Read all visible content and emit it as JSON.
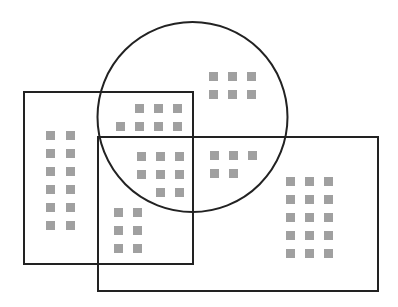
{
  "colors": {
    "background": "#ffffff",
    "stroke": "#222222",
    "square_fill": "#a0a0a0"
  },
  "shapes": {
    "left_rect": {
      "x": 24,
      "y": 92,
      "w": 169,
      "h": 172
    },
    "large_rect": {
      "x": 98,
      "y": 137,
      "w": 280,
      "h": 154
    },
    "circle": {
      "cx": 192.5,
      "cy": 117,
      "r": 95
    }
  },
  "square_size": 9,
  "regions": [
    {
      "name": "left-only",
      "count": 12,
      "squares": [
        [
          46,
          131
        ],
        [
          66,
          131
        ],
        [
          46,
          149
        ],
        [
          66,
          149
        ],
        [
          46,
          167
        ],
        [
          66,
          167
        ],
        [
          46,
          185
        ],
        [
          66,
          185
        ],
        [
          46,
          203
        ],
        [
          66,
          203
        ],
        [
          46,
          221
        ],
        [
          66,
          221
        ]
      ]
    },
    {
      "name": "left-and-circle",
      "count": 7,
      "squares": [
        [
          135,
          104
        ],
        [
          154,
          104
        ],
        [
          173,
          104
        ],
        [
          116,
          122
        ],
        [
          135,
          122
        ],
        [
          154,
          122
        ],
        [
          173,
          122
        ]
      ]
    },
    {
      "name": "left-circle-large",
      "count": 8,
      "squares": [
        [
          137,
          152
        ],
        [
          156,
          152
        ],
        [
          175,
          152
        ],
        [
          137,
          170
        ],
        [
          156,
          170
        ],
        [
          175,
          170
        ],
        [
          156,
          188
        ],
        [
          175,
          188
        ]
      ]
    },
    {
      "name": "left-and-large",
      "count": 6,
      "squares": [
        [
          114,
          208
        ],
        [
          133,
          208
        ],
        [
          114,
          226
        ],
        [
          133,
          226
        ],
        [
          114,
          244
        ],
        [
          133,
          244
        ]
      ]
    },
    {
      "name": "circle-only",
      "count": 6,
      "squares": [
        [
          209,
          72
        ],
        [
          228,
          72
        ],
        [
          247,
          72
        ],
        [
          209,
          90
        ],
        [
          228,
          90
        ],
        [
          247,
          90
        ]
      ]
    },
    {
      "name": "circle-and-large",
      "count": 5,
      "squares": [
        [
          210,
          151
        ],
        [
          229,
          151
        ],
        [
          248,
          151
        ],
        [
          210,
          169
        ],
        [
          229,
          169
        ]
      ]
    },
    {
      "name": "large-only",
      "count": 15,
      "squares": [
        [
          286,
          177
        ],
        [
          305,
          177
        ],
        [
          324,
          177
        ],
        [
          286,
          195
        ],
        [
          305,
          195
        ],
        [
          324,
          195
        ],
        [
          286,
          213
        ],
        [
          305,
          213
        ],
        [
          324,
          213
        ],
        [
          286,
          231
        ],
        [
          305,
          231
        ],
        [
          324,
          231
        ],
        [
          286,
          249
        ],
        [
          305,
          249
        ],
        [
          324,
          249
        ]
      ]
    }
  ]
}
